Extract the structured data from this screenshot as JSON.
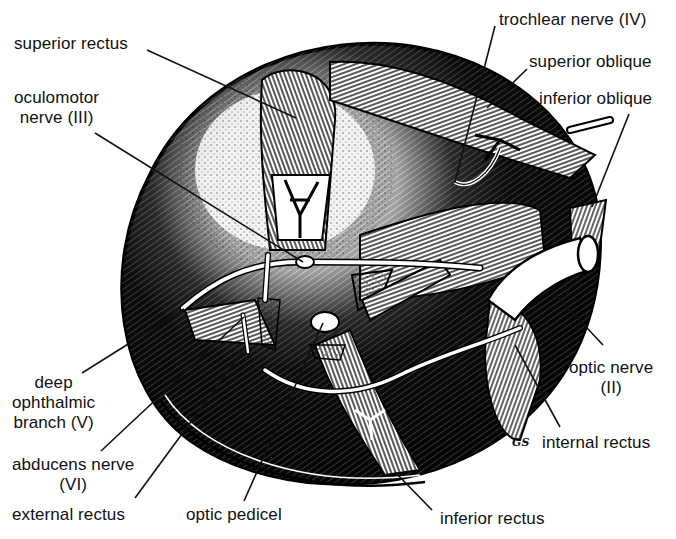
{
  "figure": {
    "signature": "GS",
    "labels": {
      "superior_rectus": "superior rectus",
      "oculomotor_line1": "oculomotor",
      "oculomotor_line2": "nerve (III)",
      "trochlear": "trochlear nerve (IV)",
      "superior_oblique": "superior oblique",
      "inferior_oblique": "inferior oblique",
      "deep_ophthalmic_line1": "deep",
      "deep_ophthalmic_line2": "ophthalmic",
      "deep_ophthalmic_line3": "branch (V)",
      "abducens_line1": "abducens nerve",
      "abducens_line2": "(VI)",
      "external_rectus": "external rectus",
      "optic_pedicel": "optic pedicel",
      "optic_nerve_line1": "optic nerve",
      "optic_nerve_line2": "(II)",
      "internal_rectus": "internal rectus",
      "inferior_rectus": "inferior rectus"
    }
  },
  "colors": {
    "ink": "#111111",
    "paper": "#ffffff"
  }
}
